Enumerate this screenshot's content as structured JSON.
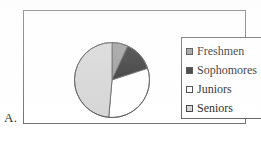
{
  "figure": {
    "label": "A."
  },
  "colors": {
    "freshmen": "#969696",
    "sophomores": "#2b2b2b",
    "juniors": "#ffffff",
    "seniors": "#d4d4d4",
    "outline": "#5a5a5a",
    "frame": "#6e6e6e",
    "legend_border": "#5f5f5f"
  },
  "legend": {
    "items": [
      {
        "label": "Freshmen",
        "swatch_name": "legend-swatch-freshmen",
        "color": "#969696"
      },
      {
        "label": "Sophomores",
        "swatch_name": "legend-swatch-sophomores",
        "color": "#2b2b2b"
      },
      {
        "label": "Juniors",
        "swatch_name": "legend-swatch-juniors",
        "color": "#ffffff"
      },
      {
        "label": "Seniors",
        "swatch_name": "legend-swatch-seniors",
        "color": "#d4d4d4"
      }
    ]
  },
  "chart_data": {
    "type": "pie",
    "title": "",
    "categories": [
      "Freshmen",
      "Sophomores",
      "Juniors",
      "Seniors"
    ],
    "values": [
      7,
      13,
      31,
      49
    ],
    "units": "percent",
    "start_angle_deg": 0,
    "direction": "clockwise",
    "slice_angles_deg": [
      25,
      47,
      113,
      175
    ],
    "colors": [
      "#969696",
      "#2b2b2b",
      "#ffffff",
      "#d4d4d4"
    ],
    "legend_position": "right",
    "grid": false,
    "data_labels": false
  }
}
